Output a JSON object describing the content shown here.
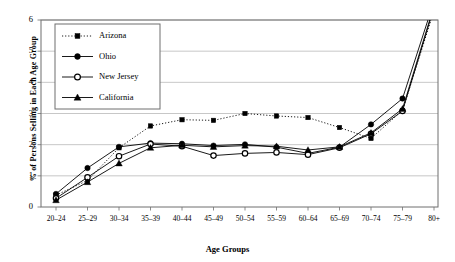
{
  "chart_data": {
    "type": "line",
    "title": "",
    "xlabel": "Age Groups",
    "ylabel": "% of Persons Selling in Each Age Group",
    "categories": [
      "20–24",
      "25–29",
      "30–34",
      "35–39",
      "40–44",
      "45–49",
      "50–54",
      "55–59",
      "60–64",
      "65–69",
      "70–74",
      "75–79",
      "80+"
    ],
    "ylim": [
      0,
      6
    ],
    "yticks": [
      0,
      1,
      2,
      3,
      4,
      5,
      6
    ],
    "grid": "horizontal",
    "legend_position": "top-left",
    "series": [
      {
        "name": "Arizona",
        "marker": "filled-square",
        "line": "dotted",
        "color": "#000000",
        "values": [
          0.38,
          0.85,
          1.9,
          2.6,
          2.8,
          2.78,
          3.0,
          2.92,
          2.87,
          2.55,
          2.2,
          3.1,
          6.3
        ]
      },
      {
        "name": "Ohio",
        "marker": "filled-circle",
        "line": "solid",
        "color": "#000000",
        "values": [
          0.42,
          1.25,
          1.93,
          2.05,
          2.03,
          1.97,
          2.01,
          1.92,
          1.72,
          1.92,
          2.65,
          3.48,
          6.6
        ]
      },
      {
        "name": "New Jersey",
        "marker": "open-circle",
        "line": "solid",
        "color": "#000000",
        "values": [
          0.28,
          0.95,
          1.63,
          2.02,
          1.95,
          1.65,
          1.72,
          1.75,
          1.68,
          1.9,
          2.35,
          3.08,
          6.4
        ]
      },
      {
        "name": "California",
        "marker": "filled-triangle",
        "line": "solid",
        "color": "#000000",
        "values": [
          0.22,
          0.8,
          1.4,
          1.9,
          1.98,
          1.93,
          1.97,
          1.95,
          1.83,
          1.93,
          2.38,
          3.15,
          6.45
        ]
      }
    ]
  },
  "axis": {
    "ytick_labels": [
      "0",
      "1",
      "2",
      "3",
      "4",
      "5",
      "6"
    ],
    "xtick_labels": [
      "20–24",
      "25–29",
      "30–34",
      "35–39",
      "40–44",
      "45–49",
      "50–54",
      "55–59",
      "60–64",
      "65–69",
      "70–74",
      "75–79",
      "80+"
    ]
  },
  "legend": {
    "entries": [
      {
        "label": "Arizona"
      },
      {
        "label": "Ohio"
      },
      {
        "label": "New Jersey"
      },
      {
        "label": "California"
      }
    ]
  },
  "colors": {
    "ink": "#000000",
    "grid": "#b9b9b9",
    "frame": "#6f6f6f"
  }
}
